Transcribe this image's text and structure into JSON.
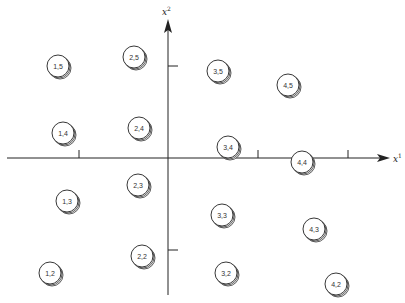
{
  "diagram": {
    "colors": {
      "ink": "#222222",
      "background": "#ffffff"
    },
    "axes": {
      "x": {
        "label": "x",
        "superscript": "1"
      },
      "y": {
        "label": "x",
        "superscript": "2"
      }
    },
    "nodes": [
      {
        "label": "1,5",
        "cx": 58,
        "cy": 66
      },
      {
        "label": "2,5",
        "cx": 134,
        "cy": 57
      },
      {
        "label": "3,5",
        "cx": 218,
        "cy": 71
      },
      {
        "label": "4,5",
        "cx": 288,
        "cy": 85
      },
      {
        "label": "1,4",
        "cx": 63,
        "cy": 133
      },
      {
        "label": "2,4",
        "cx": 139,
        "cy": 128
      },
      {
        "label": "3,4",
        "cx": 228,
        "cy": 147
      },
      {
        "label": "4,4",
        "cx": 302,
        "cy": 162
      },
      {
        "label": "1,3",
        "cx": 67,
        "cy": 201
      },
      {
        "label": "2,3",
        "cx": 138,
        "cy": 185
      },
      {
        "label": "3,3",
        "cx": 222,
        "cy": 215
      },
      {
        "label": "4,3",
        "cx": 314,
        "cy": 229
      },
      {
        "label": "1,2",
        "cx": 50,
        "cy": 273
      },
      {
        "label": "2,2",
        "cx": 142,
        "cy": 256
      },
      {
        "label": "3,2",
        "cx": 226,
        "cy": 273
      },
      {
        "label": "4,2",
        "cx": 336,
        "cy": 284
      }
    ]
  }
}
